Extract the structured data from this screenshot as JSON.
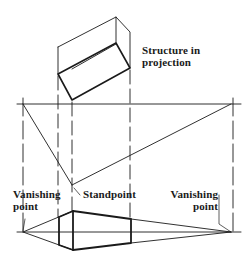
{
  "diagram": {
    "type": "two-point perspective construction",
    "labels": {
      "structure": [
        "Structure in",
        "projection"
      ],
      "vp_left": [
        "Vanishing",
        "point"
      ],
      "standpoint": "Standpoint",
      "vp_right": [
        "Vanishing",
        "point"
      ]
    },
    "colors": {
      "line": "#1a1a1a",
      "background": "#ffffff"
    }
  }
}
